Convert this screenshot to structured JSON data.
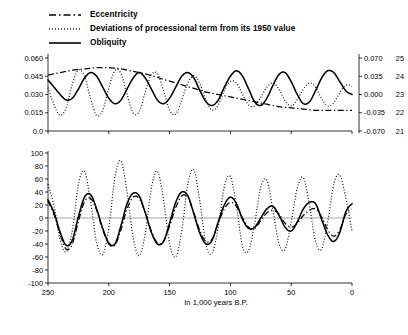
{
  "legend": {
    "items": [
      {
        "label": "Eccentricity",
        "style": "dash-dot",
        "color": "#000000"
      },
      {
        "label": "Deviations of processional term from its 1950 value",
        "style": "dotted",
        "color": "#000000"
      },
      {
        "label": "Obliquity",
        "style": "solid",
        "color": "#000000"
      }
    ]
  },
  "axes": {
    "x_label": "In 1,000 years B.P.",
    "x_ticks": [
      "250",
      "200",
      "150",
      "100",
      "50",
      "0"
    ],
    "top_left_ticks": [
      "0.060",
      "0.045",
      "0.030",
      "0.015",
      "0.0"
    ],
    "top_right_ticks": [
      "0.070",
      "0.035",
      "0.000",
      "-0.035",
      "-0.070"
    ],
    "top_far_right_ticks": [
      "25",
      "24",
      "23",
      "22",
      "21"
    ],
    "bottom_left_ticks": [
      "100",
      "80",
      "60",
      "40",
      "20",
      "0",
      "-20",
      "-40",
      "-60",
      "-80",
      "-100"
    ]
  },
  "chart_data": {
    "type": "line",
    "title": "",
    "xlabel": "In 1,000 years B.P.",
    "ylabel": "",
    "xlim": [
      250,
      0
    ],
    "grid": false,
    "legend_position": "top-left",
    "panels": [
      {
        "name": "top-panel",
        "ylim_left": [
          0.0,
          0.06
        ],
        "ylabel_left": "Eccentricity",
        "ylim_right": [
          -0.07,
          0.07
        ],
        "ylabel_right": "Deviations of processional term from its 1950 value",
        "ylim_far_right": [
          21,
          25
        ],
        "ylabel_far_right": "Obliquity (degrees)",
        "series": [
          {
            "name": "Eccentricity",
            "style": "dash-dot",
            "axis": "left",
            "x": [
              250,
              240,
              230,
              220,
              210,
              200,
              190,
              180,
              170,
              160,
              150,
              140,
              130,
              120,
              110,
              100,
              90,
              80,
              70,
              60,
              50,
              40,
              30,
              20,
              10,
              0
            ],
            "values": [
              0.046,
              0.048,
              0.05,
              0.051,
              0.052,
              0.052,
              0.051,
              0.049,
              0.047,
              0.044,
              0.041,
              0.038,
              0.035,
              0.032,
              0.03,
              0.028,
              0.026,
              0.024,
              0.022,
              0.02,
              0.019,
              0.018,
              0.017,
              0.017,
              0.017,
              0.017
            ]
          },
          {
            "name": "Deviations of processional term from its 1950 value",
            "style": "dotted",
            "axis": "right",
            "x": [
              250,
              245,
              240,
              235,
              230,
              225,
              220,
              215,
              210,
              205,
              200,
              195,
              190,
              185,
              180,
              175,
              170,
              165,
              160,
              155,
              150,
              145,
              140,
              135,
              130,
              125,
              120,
              115,
              110,
              105,
              100,
              95,
              90,
              85,
              80,
              75,
              70,
              65,
              60,
              55,
              50,
              45,
              40,
              35,
              30,
              25,
              20,
              15,
              10,
              5,
              0
            ],
            "values": [
              0.013,
              -0.02,
              -0.04,
              -0.025,
              0.02,
              0.047,
              0.035,
              -0.008,
              -0.04,
              -0.03,
              0.012,
              0.046,
              0.04,
              0.0,
              -0.035,
              -0.033,
              0.005,
              0.038,
              0.04,
              0.007,
              -0.03,
              -0.038,
              -0.01,
              0.022,
              0.036,
              0.02,
              -0.012,
              -0.03,
              -0.02,
              0.008,
              0.025,
              0.022,
              0.0,
              -0.02,
              -0.022,
              -0.005,
              0.014,
              0.022,
              0.01,
              -0.012,
              -0.022,
              -0.01,
              0.01,
              0.022,
              0.014,
              -0.008,
              -0.022,
              -0.016,
              0.004,
              0.018,
              0.016
            ]
          },
          {
            "name": "Obliquity",
            "style": "solid",
            "axis": "far-right",
            "x": [
              250,
              245,
              240,
              235,
              230,
              225,
              220,
              215,
              210,
              205,
              200,
              195,
              190,
              185,
              180,
              175,
              170,
              165,
              160,
              155,
              150,
              145,
              140,
              135,
              130,
              125,
              120,
              115,
              110,
              105,
              100,
              95,
              90,
              85,
              80,
              75,
              70,
              65,
              60,
              55,
              50,
              45,
              40,
              35,
              30,
              25,
              20,
              15,
              10,
              5,
              0
            ],
            "values": [
              23.8,
              23.4,
              23.0,
              22.7,
              22.8,
              23.3,
              23.9,
              24.2,
              24.0,
              23.4,
              22.8,
              22.5,
              22.7,
              23.3,
              23.9,
              24.2,
              23.9,
              23.3,
              22.7,
              22.5,
              22.8,
              23.4,
              24.0,
              24.2,
              23.9,
              23.2,
              22.6,
              22.4,
              22.7,
              23.4,
              24.0,
              24.3,
              24.0,
              23.3,
              22.6,
              22.4,
              22.8,
              23.5,
              24.1,
              24.2,
              23.7,
              23.0,
              22.5,
              22.6,
              23.2,
              23.9,
              24.3,
              24.2,
              23.7,
              23.2,
              23.0
            ]
          }
        ]
      },
      {
        "name": "bottom-panel",
        "ylim": [
          -100,
          100
        ],
        "ylabel": "",
        "series": [
          {
            "name": "Eccentricity",
            "style": "dash-dot",
            "x": [
              250,
              245,
              240,
              235,
              230,
              225,
              220,
              215,
              210,
              205,
              200,
              195,
              190,
              185,
              180,
              175,
              170,
              165,
              160,
              155,
              150,
              145,
              140,
              135,
              130,
              125,
              120,
              115,
              110,
              105,
              100,
              95,
              90,
              85,
              80,
              75,
              70,
              65,
              60,
              55,
              50,
              45,
              40,
              35,
              30,
              25,
              20,
              15,
              10,
              5,
              0
            ],
            "values": [
              26,
              5,
              -25,
              -48,
              -40,
              -5,
              25,
              30,
              12,
              -18,
              -40,
              -42,
              -18,
              14,
              32,
              30,
              8,
              -20,
              -38,
              -36,
              -12,
              16,
              34,
              32,
              8,
              -20,
              -36,
              -32,
              -8,
              14,
              24,
              18,
              0,
              -14,
              -16,
              -4,
              8,
              12,
              6,
              -8,
              -14,
              -8,
              4,
              12,
              14,
              2,
              -18,
              -28,
              -18,
              6,
              14
            ]
          },
          {
            "name": "Deviations of processional term from its 1950 value",
            "style": "dotted",
            "x": [
              250,
              245,
              240,
              235,
              230,
              225,
              220,
              215,
              210,
              205,
              200,
              195,
              190,
              185,
              180,
              175,
              170,
              165,
              160,
              155,
              150,
              145,
              140,
              135,
              130,
              125,
              120,
              115,
              110,
              105,
              100,
              95,
              90,
              85,
              80,
              75,
              70,
              65,
              60,
              55,
              50,
              45,
              40,
              35,
              30,
              25,
              20,
              15,
              10,
              5,
              0
            ],
            "values": [
              52,
              18,
              -34,
              -52,
              -20,
              52,
              72,
              26,
              -38,
              -56,
              -16,
              62,
              88,
              40,
              -30,
              -58,
              -24,
              46,
              72,
              28,
              -40,
              -60,
              -20,
              52,
              74,
              24,
              -42,
              -54,
              -14,
              48,
              64,
              18,
              -44,
              -50,
              -8,
              48,
              58,
              12,
              -40,
              -48,
              -6,
              46,
              62,
              20,
              -36,
              -48,
              -6,
              52,
              66,
              30,
              -20
            ]
          },
          {
            "name": "Obliquity",
            "style": "solid",
            "x": [
              250,
              245,
              240,
              235,
              230,
              225,
              220,
              215,
              210,
              205,
              200,
              195,
              190,
              185,
              180,
              175,
              170,
              165,
              160,
              155,
              150,
              145,
              140,
              135,
              130,
              125,
              120,
              115,
              110,
              105,
              100,
              95,
              90,
              85,
              80,
              75,
              70,
              65,
              60,
              55,
              50,
              45,
              40,
              35,
              30,
              25,
              20,
              15,
              10,
              5,
              0
            ],
            "values": [
              28,
              8,
              -22,
              -42,
              -34,
              2,
              32,
              36,
              14,
              -16,
              -38,
              -40,
              -12,
              22,
              38,
              34,
              8,
              -22,
              -40,
              -36,
              -8,
              24,
              40,
              34,
              6,
              -24,
              -40,
              -34,
              -6,
              20,
              32,
              22,
              -2,
              -16,
              -14,
              0,
              14,
              18,
              4,
              -14,
              -20,
              -6,
              14,
              24,
              22,
              -2,
              -26,
              -36,
              -22,
              10,
              22
            ]
          }
        ]
      }
    ]
  }
}
